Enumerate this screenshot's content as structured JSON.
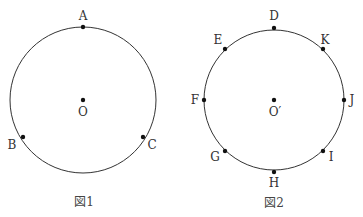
{
  "figures": [
    {
      "caption": "図1",
      "circle": {
        "cx": 83,
        "cy": 100,
        "r": 73
      },
      "center": {
        "label": "O",
        "x": 83,
        "y": 100,
        "lx": 83,
        "ly": 116
      },
      "points": [
        {
          "label": "A",
          "x": 83,
          "y": 27,
          "lx": 83,
          "ly": 20
        },
        {
          "label": "B",
          "x": 23,
          "y": 137,
          "lx": 12,
          "ly": 149
        },
        {
          "label": "C",
          "x": 143,
          "y": 137,
          "lx": 152,
          "ly": 149
        }
      ]
    },
    {
      "caption": "図2",
      "circle": {
        "cx": 274,
        "cy": 100,
        "r": 70
      },
      "center": {
        "label": "O′",
        "x": 274,
        "y": 100,
        "lx": 275,
        "ly": 116
      },
      "points": [
        {
          "label": "D",
          "x": 274,
          "y": 28,
          "lx": 274,
          "ly": 20
        },
        {
          "label": "K",
          "x": 323,
          "y": 49,
          "lx": 325,
          "ly": 44
        },
        {
          "label": "J",
          "x": 344,
          "y": 100,
          "lx": 352,
          "ly": 104
        },
        {
          "label": "I",
          "x": 323,
          "y": 151,
          "lx": 331,
          "ly": 161
        },
        {
          "label": "H",
          "x": 274,
          "y": 172,
          "lx": 274,
          "ly": 187
        },
        {
          "label": "G",
          "x": 225,
          "y": 151,
          "lx": 215,
          "ly": 161
        },
        {
          "label": "F",
          "x": 204,
          "y": 100,
          "lx": 195,
          "ly": 104
        },
        {
          "label": "E",
          "x": 225,
          "y": 49,
          "lx": 218,
          "ly": 44
        }
      ]
    }
  ],
  "colors": {
    "stroke": "#333333",
    "point": "#111111"
  }
}
